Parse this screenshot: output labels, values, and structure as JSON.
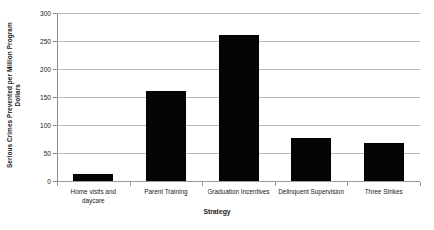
{
  "chart_data": {
    "type": "bar",
    "title": "",
    "subtitle": "",
    "xlabel": "Strategy",
    "ylabel": "Serious Crimes Prevented per Million Program Dollars",
    "ylabel_lines": [
      "Serious Crimes Prevented per Million Program",
      "Dollars"
    ],
    "categories": [
      "Home visits and daycare",
      "Parent Training",
      "Graduation Incentives",
      "Delinquent Supervision",
      "Three Strikes"
    ],
    "category_lines": [
      [
        "Home visits and",
        "daycare"
      ],
      [
        "Parent Training"
      ],
      [
        "Graduation Incentives"
      ],
      [
        "Delinquent Supervision"
      ],
      [
        "Three Strikes"
      ]
    ],
    "values": [
      12,
      160,
      260,
      77,
      68
    ],
    "ylim": [
      0,
      300
    ],
    "yticks": [
      0,
      50,
      100,
      150,
      200,
      250,
      300
    ],
    "ytick_labels": [
      "0",
      "50",
      "100",
      "150",
      "200",
      "250",
      "300"
    ],
    "grid": true,
    "grid_axis": "y",
    "legend": false,
    "legend_position": "none",
    "bar_color": "#050505",
    "grid_color": "#b9b9b9",
    "axis_color": "#8a8a8a",
    "text_color": "#1a1a1a",
    "background": "#ffffff"
  }
}
